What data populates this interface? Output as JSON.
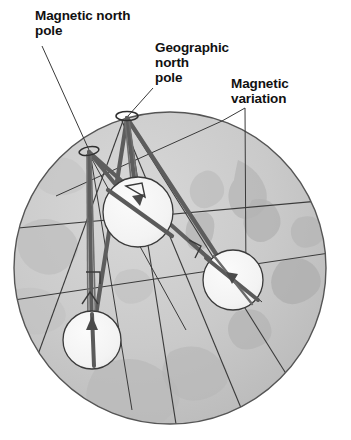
{
  "figure": {
    "type": "diagram",
    "background_color": "#ffffff"
  },
  "labels": {
    "magnetic_north_pole": "Magnetic north\npole",
    "geographic_north_pole": "Geographic\nnorth\npole",
    "magnetic_variation": "Magnetic\nvariation"
  },
  "colors": {
    "globe_fill": "#c9c9c9",
    "globe_edge": "#555555",
    "land_shade": "#b4b4b4",
    "compass_face": "#f2f2f2",
    "compass_edge": "#3a3a3a",
    "needle": "#5a5a5a",
    "meridian_line": "#3a3a3a",
    "leader_line": "#3a3a3a",
    "text": "#111111"
  },
  "geometry": {
    "globe": {
      "cx": 170,
      "cy": 268,
      "r": 156
    },
    "geographic_pole": {
      "x": 127,
      "y": 116
    },
    "magnetic_pole": {
      "x": 89,
      "y": 151
    },
    "compasses": [
      {
        "name": "compass-upper",
        "cx": 138,
        "cy": 212,
        "r": 35
      },
      {
        "name": "compass-right",
        "cx": 233,
        "cy": 280,
        "r": 30
      },
      {
        "name": "compass-lower",
        "cx": 92,
        "cy": 340,
        "r": 29
      }
    ]
  },
  "leader_lines": {
    "magnetic_north_pole": [
      [
        42,
        46
      ],
      [
        89,
        151
      ]
    ],
    "geographic_north_pole": [
      [
        153,
        88
      ],
      [
        127,
        116
      ]
    ],
    "magnetic_variation": [
      [
        245,
        108
      ],
      [
        222,
        120
      ]
    ]
  }
}
